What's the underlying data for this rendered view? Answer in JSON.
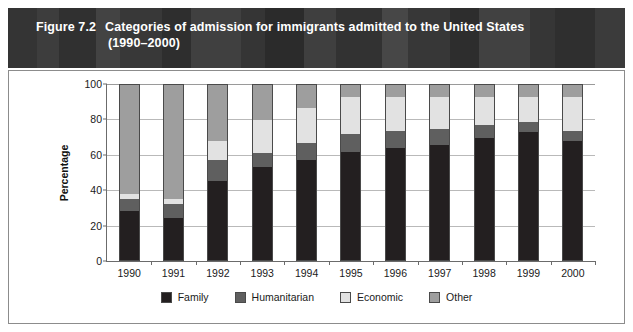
{
  "figure": {
    "number": "Figure 7.2",
    "title_line1": "Categories of admission for immigrants admitted to the United States",
    "title_line2": "(1990–2000)"
  },
  "colors": {
    "family": "#231f20",
    "humanitarian": "#5f5f5f",
    "economic": "#e2e2e2",
    "other": "#9e9e9e",
    "banner_bg": "#3a3a3a",
    "grid": "#b9b9b9",
    "axis": "#6b6b6b",
    "panel_border": "#8c8c8c"
  },
  "legend": {
    "items": [
      {
        "label": "Family",
        "key": "family"
      },
      {
        "label": "Humanitarian",
        "key": "humanitarian"
      },
      {
        "label": "Economic",
        "key": "economic"
      },
      {
        "label": "Other",
        "key": "other"
      }
    ]
  },
  "chart_data": {
    "type": "bar",
    "stacked": true,
    "xlabel": "",
    "ylabel": "Percentage",
    "ylim": [
      0,
      100
    ],
    "yticks": [
      0,
      20,
      40,
      60,
      80,
      100
    ],
    "grid": true,
    "legend_position": "bottom",
    "categories": [
      "1990",
      "1991",
      "1992",
      "1993",
      "1994",
      "1995",
      "1996",
      "1997",
      "1998",
      "1999",
      "2000"
    ],
    "series": [
      {
        "name": "Family",
        "values": [
          28,
          24,
          45,
          53,
          57,
          62,
          64,
          66,
          70,
          73,
          68
        ]
      },
      {
        "name": "Humanitarian",
        "values": [
          7,
          8,
          12,
          8,
          10,
          10,
          10,
          9,
          7,
          6,
          6
        ]
      },
      {
        "name": "Economic",
        "values": [
          3,
          3,
          11,
          19,
          20,
          21,
          19,
          18,
          16,
          14,
          19
        ]
      },
      {
        "name": "Other",
        "values": [
          62,
          65,
          32,
          20,
          13,
          7,
          7,
          7,
          7,
          7,
          7
        ]
      }
    ]
  }
}
